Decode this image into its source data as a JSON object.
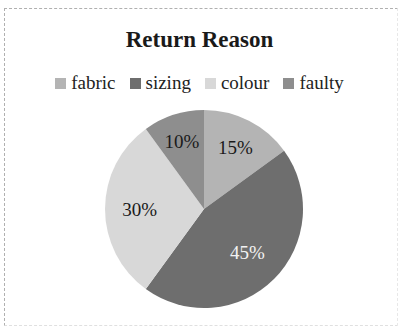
{
  "chart_data": {
    "type": "pie",
    "title": "Return Reason",
    "categories": [
      "fabric",
      "sizing",
      "colour",
      "faulty"
    ],
    "values": [
      15,
      45,
      30,
      10
    ],
    "labels": [
      "15%",
      "45%",
      "30%",
      "10%"
    ],
    "colors": [
      "#b4b4b4",
      "#6e6e6e",
      "#d8d8d8",
      "#8e8e8e"
    ],
    "legend_position": "top",
    "start_angle": "12 o'clock, clockwise"
  },
  "legend": [
    {
      "label": "fabric",
      "color": "#b4b4b4"
    },
    {
      "label": "sizing",
      "color": "#6e6e6e"
    },
    {
      "label": "colour",
      "color": "#d8d8d8"
    },
    {
      "label": "faulty",
      "color": "#8e8e8e"
    }
  ]
}
